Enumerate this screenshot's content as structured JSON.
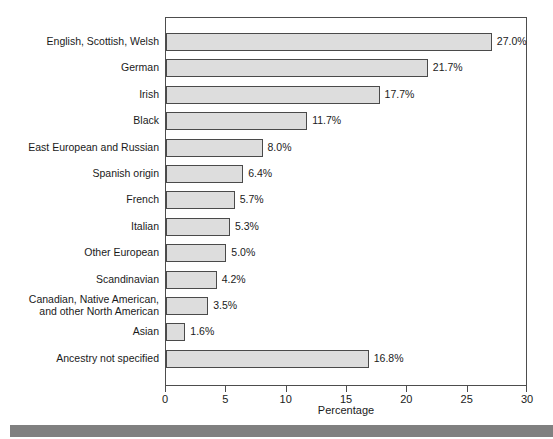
{
  "chart_data": {
    "type": "bar",
    "orientation": "horizontal",
    "title": "",
    "xlabel": "Percentage",
    "ylabel": "",
    "xlim": [
      0,
      30
    ],
    "xticks": [
      0,
      5,
      10,
      15,
      20,
      25,
      30
    ],
    "xtick_labels": [
      "0",
      "5",
      "10",
      "15",
      "20",
      "25",
      "30"
    ],
    "grid": false,
    "legend": false,
    "value_suffix": "%",
    "categories": [
      "English, Scottish, Welsh",
      "German",
      "Irish",
      "Black",
      "East European and Russian",
      "Spanish origin",
      "French",
      "Italian",
      "Other European",
      "Scandinavian",
      "Canadian, Native American,\nand other North American",
      "Asian",
      "Ancestry not specified"
    ],
    "values": [
      27.0,
      21.7,
      17.7,
      11.7,
      8.0,
      6.4,
      5.7,
      5.3,
      5.0,
      4.2,
      3.5,
      1.6,
      16.8
    ],
    "value_labels": [
      "27.0%",
      "21.7%",
      "17.7%",
      "11.7%",
      "8.0%",
      "6.4%",
      "5.7%",
      "5.3%",
      "5.0%",
      "4.2%",
      "3.5%",
      "1.6%",
      "16.8%"
    ]
  },
  "colors": {
    "bar_fill": "#dddddd",
    "bar_border": "#4a4a4a",
    "frame": "#4d4d4d",
    "text": "#1a1a1a",
    "footer_band": "#808080",
    "background": "#ffffff"
  }
}
